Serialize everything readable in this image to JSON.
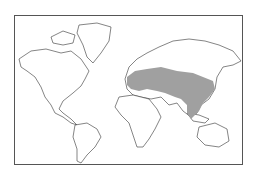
{
  "map": {
    "type": "world-distribution-map",
    "projection": "mercator",
    "shaded_region_color": "#a0a0a0",
    "land_fill": "#ffffff",
    "outline_color": "#333333",
    "shaded_region_description": "Eurasian band from eastern Europe across Central Asia to China, Korea and into Southeast Asia"
  }
}
